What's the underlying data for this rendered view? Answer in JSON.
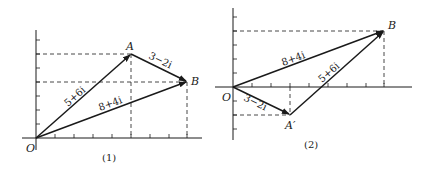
{
  "figures": [
    {
      "caption": "(1)",
      "origin_label": "O",
      "points": {
        "A": "A",
        "B": "B"
      },
      "vectors": [
        {
          "from": "O",
          "to": "A",
          "label": "5+6i"
        },
        {
          "from": "A",
          "to": "B",
          "label": "3−2i"
        },
        {
          "from": "O",
          "to": "B",
          "label": "8+4i"
        }
      ]
    },
    {
      "caption": "(2)",
      "origin_label": "O",
      "points": {
        "A": "A′",
        "B": "B"
      },
      "vectors": [
        {
          "from": "O",
          "to": "A′",
          "label": "3−2i"
        },
        {
          "from": "A′",
          "to": "B",
          "label": "5+6i"
        },
        {
          "from": "O",
          "to": "B",
          "label": "8+4i"
        }
      ]
    }
  ],
  "colors": {
    "ink": "#1a1a1a",
    "background": "#ffffff"
  }
}
